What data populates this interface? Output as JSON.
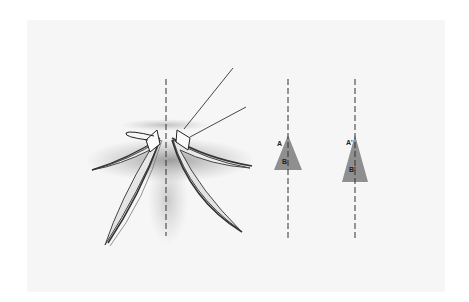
{
  "figure": {
    "midline_style": "dashed",
    "colors": {
      "background": "#ffffff",
      "panel": "#f6f6f6",
      "triangle_fill": "#8f8f8f",
      "line": "#333333"
    }
  },
  "diagram": {
    "before": {
      "label_a": "A",
      "label_b": "B"
    },
    "after": {
      "label_a": "A'",
      "label_b": "B'"
    }
  }
}
